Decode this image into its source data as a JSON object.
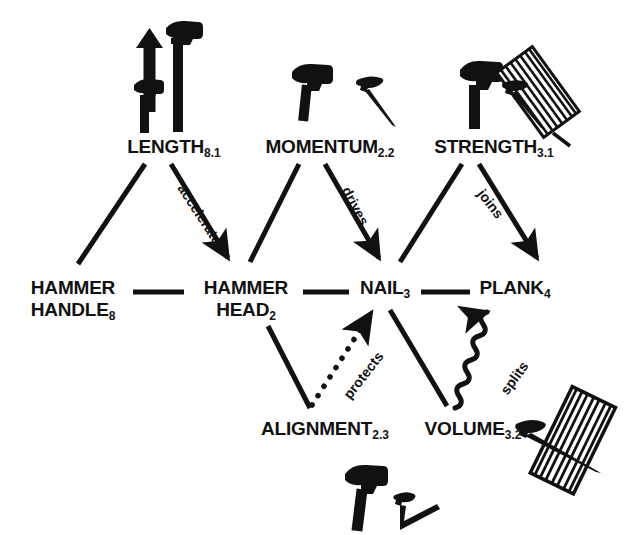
{
  "diagram": {
    "background_color": "#ffffff",
    "ink_color": "#111111",
    "nodes": [
      {
        "id": "length",
        "label": "LENGTH",
        "subscript": "8.1",
        "x": 112,
        "y": 136,
        "width": 124,
        "row": "top"
      },
      {
        "id": "momentum",
        "label": "MOMENTUM",
        "subscript": "2.2",
        "x": 247,
        "y": 136,
        "width": 166,
        "row": "top"
      },
      {
        "id": "strength",
        "label": "STRENGTH",
        "subscript": "3.1",
        "x": 418,
        "y": 136,
        "width": 152,
        "row": "top"
      },
      {
        "id": "hammer-handle",
        "label": "HAMMER",
        "label2": "HANDLE",
        "subscript": "8",
        "x": 18,
        "y": 277,
        "width": 110,
        "row": "middle"
      },
      {
        "id": "hammer-head",
        "label": "HAMMER",
        "label2": "HEAD",
        "subscript": "2",
        "x": 189,
        "y": 277,
        "width": 110,
        "row": "middle"
      },
      {
        "id": "nail",
        "label": "NAIL",
        "subscript": "3",
        "x": 352,
        "y": 277,
        "width": 66,
        "row": "middle"
      },
      {
        "id": "plank",
        "label": "PLANK",
        "subscript": "4",
        "x": 473,
        "y": 277,
        "width": 84,
        "row": "middle"
      },
      {
        "id": "alignment",
        "label": "ALIGNMENT",
        "subscript": "2.3",
        "x": 245,
        "y": 418,
        "width": 160,
        "row": "bottom"
      },
      {
        "id": "volume",
        "label": "VOLUME",
        "subscript": "3.2",
        "x": 414,
        "y": 418,
        "width": 118,
        "row": "bottom"
      }
    ],
    "edges": [
      {
        "id": "length-handle",
        "from": "length",
        "to": "hammer-handle",
        "label": "",
        "style": "solid",
        "arrow": false
      },
      {
        "id": "length-head",
        "from": "length",
        "to": "hammer-head",
        "label": "accelerates",
        "style": "solid",
        "arrow": true
      },
      {
        "id": "momentum-head",
        "from": "momentum",
        "to": "hammer-head",
        "label": "",
        "style": "solid",
        "arrow": false
      },
      {
        "id": "momentum-nail",
        "from": "momentum",
        "to": "nail",
        "label": "drives",
        "style": "solid",
        "arrow": true
      },
      {
        "id": "strength-nail",
        "from": "strength",
        "to": "nail",
        "label": "",
        "style": "solid",
        "arrow": false
      },
      {
        "id": "strength-plank",
        "from": "strength",
        "to": "plank",
        "label": "joins",
        "style": "solid",
        "arrow": true
      },
      {
        "id": "handle-head",
        "from": "hammer-handle",
        "to": "hammer-head",
        "label": "",
        "style": "solid",
        "arrow": false
      },
      {
        "id": "head-nail",
        "from": "hammer-head",
        "to": "nail",
        "label": "",
        "style": "solid",
        "arrow": false
      },
      {
        "id": "nail-plank",
        "from": "nail",
        "to": "plank",
        "label": "",
        "style": "solid",
        "arrow": false
      },
      {
        "id": "head-alignment",
        "from": "hammer-head",
        "to": "alignment",
        "label": "",
        "style": "solid",
        "arrow": false
      },
      {
        "id": "alignment-nail",
        "from": "alignment",
        "to": "nail",
        "label": "protects",
        "style": "dotted",
        "arrow": true
      },
      {
        "id": "nail-volume",
        "from": "nail",
        "to": "volume",
        "label": "",
        "style": "solid",
        "arrow": false
      },
      {
        "id": "volume-plank",
        "from": "volume",
        "to": "plank",
        "label": "splits",
        "style": "wavy",
        "arrow": true
      }
    ],
    "edge_labels": [
      {
        "id": "accelerates",
        "text": "accelerates",
        "x": 188,
        "y": 181,
        "rotation": 57
      },
      {
        "id": "drives",
        "text": "drives",
        "x": 353,
        "y": 184,
        "rotation": 62
      },
      {
        "id": "joins",
        "text": "joins",
        "x": 487,
        "y": 186,
        "rotation": 52
      },
      {
        "id": "protects",
        "text": "protects",
        "x": 340,
        "y": 392,
        "rotation": -52
      },
      {
        "id": "splits",
        "text": "splits",
        "x": 497,
        "y": 388,
        "rotation": -54
      }
    ],
    "icons": [
      {
        "id": "length-icon",
        "name": "hammers-with-up-arrow-icon",
        "description": "short hammer, upward arrow, tall hammer",
        "x": 128,
        "y": 16,
        "width": 96,
        "height": 116
      },
      {
        "id": "momentum-icon",
        "name": "hammer-and-nail-icon",
        "description": "hammer beside a nail",
        "x": 288,
        "y": 58,
        "width": 112,
        "height": 62
      },
      {
        "id": "strength-icon",
        "name": "hammer-nail-in-plank-icon",
        "description": "hammer and nail driven into a wood plank",
        "x": 455,
        "y": 52,
        "width": 122,
        "height": 76
      },
      {
        "id": "alignment-icon",
        "name": "hammer-with-bent-nail-icon",
        "description": "hammer beside a bent crooked nail",
        "x": 340,
        "y": 462,
        "width": 108,
        "height": 62
      },
      {
        "id": "volume-icon",
        "name": "nail-splitting-plank-icon",
        "description": "nail piercing and splitting a plank",
        "x": 512,
        "y": 392,
        "width": 112,
        "height": 104
      }
    ]
  }
}
